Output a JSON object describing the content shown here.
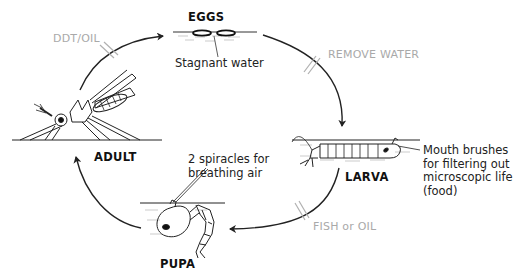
{
  "diagram": {
    "type": "life-cycle",
    "stages": [
      {
        "id": "eggs",
        "label": "EGGS",
        "note": "Stagnant water"
      },
      {
        "id": "larva",
        "label": "LARVA",
        "note_lines": [
          "Mouth brushes",
          "for filtering out",
          "microscopic life",
          "(food)"
        ]
      },
      {
        "id": "pupa",
        "label": "PUPA",
        "note_lines": [
          "2 spiracles for",
          "breathing air"
        ]
      },
      {
        "id": "adult",
        "label": "ADULT"
      }
    ],
    "transitions": [
      {
        "from": "adult",
        "to": "eggs",
        "control": "DDT/OIL"
      },
      {
        "from": "eggs",
        "to": "larva",
        "control": "REMOVE WATER"
      },
      {
        "from": "larva",
        "to": "pupa",
        "control": "FISH or OIL"
      },
      {
        "from": "pupa",
        "to": "adult",
        "control": ""
      }
    ],
    "colors": {
      "line": "#222222",
      "control_text": "#a9a9a9",
      "control_mark": "#b0b0b0",
      "water": "#9a9a9a"
    }
  }
}
